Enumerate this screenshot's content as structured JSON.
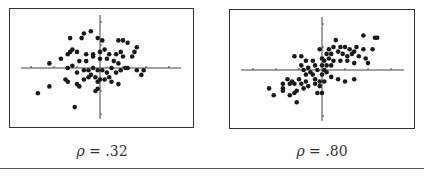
{
  "chart_data": [
    {
      "type": "scatter",
      "title": "",
      "caption_symbol": "ρ",
      "caption_value": ".32",
      "caption": "ρ = .32",
      "xlabel": "",
      "ylabel": "",
      "grid": false,
      "axes": "centered crosshair with tick marks, no tick labels",
      "xlim": [
        -3.5,
        3.5
      ],
      "ylim": [
        -2.3,
        2.3
      ],
      "x_ticks": [
        -3,
        -2,
        -1,
        1,
        2,
        3
      ],
      "y_ticks": [
        -2,
        -1,
        1,
        2
      ],
      "points": [
        [
          -1.3,
          1.3
        ],
        [
          -0.8,
          1.3
        ],
        [
          -0.7,
          1.5
        ],
        [
          -0.4,
          1.6
        ],
        [
          -0.1,
          1.3
        ],
        [
          0.1,
          1.2
        ],
        [
          0.8,
          1.2
        ],
        [
          1.0,
          1.2
        ],
        [
          1.2,
          1.1
        ],
        [
          1.6,
          0.9
        ],
        [
          1.5,
          0.7
        ],
        [
          -1.3,
          0.7
        ],
        [
          -1.2,
          0.8
        ],
        [
          -1.0,
          0.7
        ],
        [
          -1.4,
          0.6
        ],
        [
          -0.6,
          0.6
        ],
        [
          -0.3,
          0.6
        ],
        [
          0.0,
          0.7
        ],
        [
          0.2,
          0.8
        ],
        [
          0.4,
          0.6
        ],
        [
          0.7,
          0.6
        ],
        [
          0.9,
          0.7
        ],
        [
          1.0,
          0.5
        ],
        [
          1.4,
          0.5
        ],
        [
          -2.2,
          0.2
        ],
        [
          -1.7,
          0.4
        ],
        [
          -1.2,
          0.1
        ],
        [
          -1.4,
          0.0
        ],
        [
          -0.9,
          0.3
        ],
        [
          -0.6,
          0.3
        ],
        [
          -0.3,
          0.5
        ],
        [
          0.0,
          0.4
        ],
        [
          0.3,
          0.4
        ],
        [
          0.6,
          0.3
        ],
        [
          0.8,
          0.2
        ],
        [
          1.2,
          0.0
        ],
        [
          1.6,
          -0.1
        ],
        [
          1.8,
          -0.3
        ],
        [
          1.9,
          -0.1
        ],
        [
          -1.0,
          -0.2
        ],
        [
          -0.7,
          -0.1
        ],
        [
          -0.5,
          -0.1
        ],
        [
          -0.4,
          -0.3
        ],
        [
          -0.3,
          0.0
        ],
        [
          -0.1,
          -0.1
        ],
        [
          0.1,
          -0.1
        ],
        [
          0.3,
          -0.2
        ],
        [
          0.5,
          0.0
        ],
        [
          0.7,
          -0.2
        ],
        [
          0.9,
          -0.1
        ],
        [
          1.1,
          0.0
        ],
        [
          -1.5,
          -0.5
        ],
        [
          -1.4,
          -0.6
        ],
        [
          -1.0,
          -0.7
        ],
        [
          -0.9,
          -0.8
        ],
        [
          -0.7,
          -0.5
        ],
        [
          -0.5,
          -0.4
        ],
        [
          -0.2,
          -0.4
        ],
        [
          -0.1,
          -0.6
        ],
        [
          0.0,
          -0.5
        ],
        [
          0.2,
          -0.5
        ],
        [
          0.4,
          -0.4
        ],
        [
          0.5,
          -0.6
        ],
        [
          0.8,
          -0.7
        ],
        [
          -0.2,
          -1.0
        ],
        [
          -0.1,
          -0.9
        ],
        [
          -2.2,
          -0.8
        ],
        [
          -2.7,
          -1.1
        ],
        [
          -1.1,
          -1.7
        ]
      ]
    },
    {
      "type": "scatter",
      "title": "",
      "caption_symbol": "ρ",
      "caption_value": ".80",
      "caption": "ρ = .80",
      "xlabel": "",
      "ylabel": "",
      "grid": false,
      "axes": "centered crosshair with tick marks, no tick labels",
      "xlim": [
        -3.5,
        3.5
      ],
      "ylim": [
        -2.3,
        2.3
      ],
      "x_ticks": [
        -3,
        -2,
        -1,
        1,
        2,
        3
      ],
      "y_ticks": [
        -2,
        -1,
        1,
        2
      ],
      "points": [
        [
          1.8,
          1.5
        ],
        [
          2.3,
          1.4
        ],
        [
          2.4,
          1.4
        ],
        [
          0.6,
          1.3
        ],
        [
          1.5,
          1.0
        ],
        [
          1.8,
          0.9
        ],
        [
          2.2,
          0.9
        ],
        [
          -1.2,
          0.6
        ],
        [
          -0.9,
          0.6
        ],
        [
          -0.1,
          0.9
        ],
        [
          0.3,
          0.9
        ],
        [
          0.5,
          1.0
        ],
        [
          0.8,
          1.0
        ],
        [
          1.0,
          1.0
        ],
        [
          1.2,
          0.9
        ],
        [
          1.4,
          0.8
        ],
        [
          0.2,
          0.7
        ],
        [
          0.4,
          0.7
        ],
        [
          0.7,
          0.8
        ],
        [
          0.9,
          0.7
        ],
        [
          1.1,
          0.6
        ],
        [
          1.3,
          0.7
        ],
        [
          1.6,
          0.6
        ],
        [
          1.9,
          0.5
        ],
        [
          2.0,
          0.3
        ],
        [
          -0.7,
          0.4
        ],
        [
          -0.4,
          0.4
        ],
        [
          0.0,
          0.5
        ],
        [
          0.1,
          0.4
        ],
        [
          0.3,
          0.5
        ],
        [
          0.5,
          0.4
        ],
        [
          0.8,
          0.4
        ],
        [
          1.1,
          0.4
        ],
        [
          1.4,
          0.3
        ],
        [
          -0.9,
          0.2
        ],
        [
          -0.6,
          0.1
        ],
        [
          -0.3,
          0.2
        ],
        [
          0.0,
          0.2
        ],
        [
          0.2,
          0.2
        ],
        [
          0.4,
          0.2
        ],
        [
          -0.8,
          0.0
        ],
        [
          -0.5,
          -0.1
        ],
        [
          -0.2,
          0.0
        ],
        [
          0.1,
          0.0
        ],
        [
          0.2,
          -0.1
        ],
        [
          -0.7,
          -0.2
        ],
        [
          -0.4,
          -0.2
        ],
        [
          0.0,
          -0.2
        ],
        [
          0.4,
          -0.3
        ],
        [
          0.7,
          -0.4
        ],
        [
          1.0,
          -0.5
        ],
        [
          1.4,
          -0.4
        ],
        [
          -1.5,
          -0.4
        ],
        [
          -1.3,
          -0.5
        ],
        [
          -1.0,
          -0.4
        ],
        [
          -0.7,
          -0.5
        ],
        [
          -0.3,
          -0.4
        ],
        [
          -0.1,
          -0.5
        ],
        [
          -1.7,
          -0.6
        ],
        [
          -1.4,
          -0.6
        ],
        [
          -1.2,
          -0.6
        ],
        [
          -0.9,
          -0.6
        ],
        [
          -0.6,
          -0.7
        ],
        [
          -0.3,
          -0.6
        ],
        [
          -0.1,
          -0.7
        ],
        [
          0.1,
          -0.5
        ],
        [
          -1.7,
          -0.8
        ],
        [
          -1.1,
          -0.9
        ],
        [
          -0.8,
          -0.8
        ],
        [
          -0.2,
          -1.0
        ],
        [
          0.0,
          -1.0
        ],
        [
          -2.3,
          -0.8
        ],
        [
          -2.1,
          -1.1
        ],
        [
          -1.7,
          -0.9
        ],
        [
          -1.4,
          -1.1
        ],
        [
          -1.2,
          -1.0
        ],
        [
          -1.1,
          -1.4
        ]
      ]
    }
  ],
  "panels": [
    {
      "caption_symbol": "ρ",
      "caption_eq": "=",
      "caption_value": ".32"
    },
    {
      "caption_symbol": "ρ",
      "caption_eq": "=",
      "caption_value": ".80"
    }
  ],
  "colors": {
    "dot": "#1a1a1a",
    "axis": "#444444",
    "border": "#333333",
    "rule": "#555555"
  }
}
